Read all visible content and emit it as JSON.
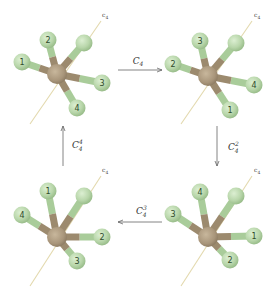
{
  "colors": {
    "central_atom": "#a8957a",
    "ligand_atom": "#b8d6aa",
    "ligand_bond": "#a9cc9a",
    "central_bond": "#9c8a6e",
    "axis_line": "#e3d9ae",
    "arrow": "#666666"
  },
  "axis_label": "c4",
  "molecules": [
    {
      "id": "top-left",
      "center": [
        57,
        74
      ],
      "axis": [
        [
          30,
          124
        ],
        [
          101,
          21
        ]
      ],
      "axis_label_pos": [
        102,
        17
      ],
      "atoms": [
        {
          "label": "1",
          "pos": [
            22,
            62
          ]
        },
        {
          "label": "2",
          "pos": [
            48,
            40
          ]
        },
        {
          "label": "",
          "pos": [
            84,
            43
          ]
        },
        {
          "label": "3",
          "pos": [
            102,
            83
          ]
        },
        {
          "label": "4",
          "pos": [
            77,
            108
          ]
        }
      ]
    },
    {
      "id": "top-right",
      "center": [
        208,
        76
      ],
      "axis": [
        [
          181,
          124
        ],
        [
          252,
          21
        ]
      ],
      "axis_label_pos": [
        254,
        17
      ],
      "atoms": [
        {
          "label": "2",
          "pos": [
            173,
            64
          ]
        },
        {
          "label": "3",
          "pos": [
            200,
            41
          ]
        },
        {
          "label": "",
          "pos": [
            236,
            43
          ]
        },
        {
          "label": "4",
          "pos": [
            254,
            85
          ]
        },
        {
          "label": "1",
          "pos": [
            230,
            110
          ]
        }
      ]
    },
    {
      "id": "bottom-left",
      "center": [
        57,
        237
      ],
      "axis": [
        [
          30,
          286
        ],
        [
          101,
          176
        ]
      ],
      "axis_label_pos": [
        102,
        172
      ],
      "atoms": [
        {
          "label": "4",
          "pos": [
            22,
            215
          ]
        },
        {
          "label": "1",
          "pos": [
            48,
            191
          ]
        },
        {
          "label": "",
          "pos": [
            84,
            196
          ]
        },
        {
          "label": "2",
          "pos": [
            102,
            237
          ]
        },
        {
          "label": "3",
          "pos": [
            77,
            261
          ]
        }
      ]
    },
    {
      "id": "bottom-right",
      "center": [
        208,
        237
      ],
      "axis": [
        [
          181,
          286
        ],
        [
          252,
          176
        ]
      ],
      "axis_label_pos": [
        254,
        172
      ],
      "atoms": [
        {
          "label": "3",
          "pos": [
            173,
            214
          ]
        },
        {
          "label": "4",
          "pos": [
            200,
            192
          ]
        },
        {
          "label": "",
          "pos": [
            236,
            196
          ]
        },
        {
          "label": "1",
          "pos": [
            254,
            236
          ]
        },
        {
          "label": "2",
          "pos": [
            230,
            260
          ]
        }
      ]
    }
  ],
  "arrows": [
    {
      "id": "arrow-top",
      "from": "top-left",
      "to": "top-right",
      "label_base": "C",
      "label_sub": "4",
      "label_sup": "",
      "label": "C4"
    },
    {
      "id": "arrow-right",
      "from": "top-right",
      "to": "bottom-right",
      "label_base": "C",
      "label_sub": "4",
      "label_sup": "2",
      "label": "C4^2"
    },
    {
      "id": "arrow-bottom",
      "from": "bottom-right",
      "to": "bottom-left",
      "label_base": "C",
      "label_sub": "4",
      "label_sup": "3",
      "label": "C4^3"
    },
    {
      "id": "arrow-left",
      "from": "bottom-left",
      "to": "top-left",
      "label_base": "C",
      "label_sub": "4",
      "label_sup": "4",
      "label": "C4^4"
    }
  ]
}
